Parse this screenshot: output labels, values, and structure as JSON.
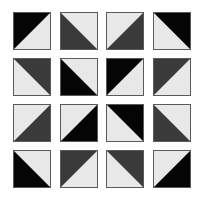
{
  "colors": {
    "light": "#e8e8e8",
    "dark_gray": "#3a3a3a",
    "black": "#050505",
    "border": "#5a5a5a"
  },
  "grid": {
    "rows": 4,
    "cols": 4,
    "tiles": [
      {
        "row": 1,
        "col": 1,
        "dark_corner": "top-left",
        "shade": "black"
      },
      {
        "row": 1,
        "col": 2,
        "dark_corner": "bottom-left",
        "shade": "dark_gray"
      },
      {
        "row": 1,
        "col": 3,
        "dark_corner": "bottom-right",
        "shade": "dark_gray"
      },
      {
        "row": 1,
        "col": 4,
        "dark_corner": "top-right",
        "shade": "black"
      },
      {
        "row": 2,
        "col": 1,
        "dark_corner": "top-right",
        "shade": "dark_gray"
      },
      {
        "row": 2,
        "col": 2,
        "dark_corner": "bottom-left",
        "shade": "black"
      },
      {
        "row": 2,
        "col": 3,
        "dark_corner": "top-left",
        "shade": "black"
      },
      {
        "row": 2,
        "col": 4,
        "dark_corner": "top-left",
        "shade": "dark_gray"
      },
      {
        "row": 3,
        "col": 1,
        "dark_corner": "bottom-right",
        "shade": "dark_gray"
      },
      {
        "row": 3,
        "col": 2,
        "dark_corner": "bottom-right",
        "shade": "black"
      },
      {
        "row": 3,
        "col": 3,
        "dark_corner": "top-right",
        "shade": "black"
      },
      {
        "row": 3,
        "col": 4,
        "dark_corner": "bottom-left",
        "shade": "dark_gray"
      },
      {
        "row": 4,
        "col": 1,
        "dark_corner": "bottom-left",
        "shade": "black"
      },
      {
        "row": 4,
        "col": 2,
        "dark_corner": "top-left",
        "shade": "dark_gray"
      },
      {
        "row": 4,
        "col": 3,
        "dark_corner": "top-right",
        "shade": "dark_gray"
      },
      {
        "row": 4,
        "col": 4,
        "dark_corner": "bottom-right",
        "shade": "black"
      }
    ]
  }
}
